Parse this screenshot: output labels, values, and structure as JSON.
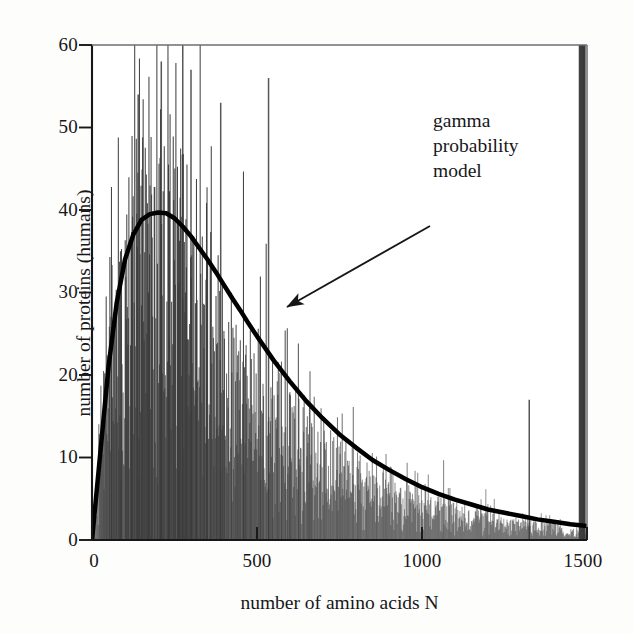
{
  "chart_data": {
    "type": "bar",
    "title": "",
    "subtitle": "",
    "xlabel": "number of amino acids N",
    "ylabel": "number of proteins (humans)",
    "xlim": [
      0,
      1500
    ],
    "ylim": [
      0,
      60
    ],
    "xticks": [
      0,
      500,
      1000,
      1500
    ],
    "xtick_labels": [
      "0",
      "500",
      "1000",
      "1500"
    ],
    "yticks": [
      0,
      10,
      20,
      30,
      40,
      50,
      60
    ],
    "ytick_labels": [
      "0",
      "10",
      "20",
      "30",
      "40",
      "50",
      "60"
    ],
    "grid": false,
    "legend_position": "none",
    "annotations": [
      {
        "text_lines": [
          "gamma",
          "probability",
          "model"
        ],
        "text": "gamma probability model",
        "arrow_from_x": 960,
        "arrow_from_y": 43,
        "arrow_to_x": 580,
        "arrow_to_y": 28
      }
    ],
    "series": [
      {
        "name": "histogram of human protein lengths",
        "type": "impulse",
        "render": "vertical-spikes",
        "color": "#3a3a3a",
        "bin_width": 1,
        "note": "Dense noisy per-N counts; envelope follows the gamma model with large scatter, several spikes clipped at/above 60.",
        "x": [
          5,
          15,
          25,
          35,
          45,
          55,
          65,
          75,
          85,
          95,
          105,
          115,
          125,
          135,
          145,
          155,
          165,
          175,
          185,
          195,
          205,
          215,
          225,
          235,
          245,
          255,
          265,
          275,
          285,
          295,
          305,
          315,
          325,
          335,
          345,
          355,
          365,
          375,
          385,
          395,
          405,
          415,
          425,
          435,
          445,
          455,
          465,
          475,
          485,
          495,
          505,
          515,
          525,
          535,
          545,
          555,
          565,
          575,
          585,
          595,
          605,
          615,
          625,
          635,
          645,
          655,
          665,
          675,
          685,
          695,
          705,
          715,
          725,
          735,
          745,
          755,
          765,
          775,
          785,
          795,
          805,
          815,
          825,
          835,
          845,
          855,
          865,
          875,
          885,
          895,
          905,
          915,
          925,
          935,
          945,
          955,
          965,
          975,
          985,
          995,
          1005,
          1015,
          1025,
          1035,
          1045,
          1055,
          1065,
          1075,
          1085,
          1095,
          1105,
          1115,
          1125,
          1135,
          1145,
          1155,
          1165,
          1175,
          1185,
          1195,
          1205,
          1215,
          1225,
          1235,
          1245,
          1255,
          1265,
          1275,
          1285,
          1295,
          1305,
          1315,
          1325,
          1335,
          1345,
          1355,
          1365,
          1375,
          1385,
          1395,
          1405,
          1415,
          1425,
          1435,
          1445,
          1455,
          1465,
          1475,
          1485,
          1495
        ],
        "y_envelope_mean": [
          2,
          6,
          12,
          18,
          24,
          28,
          32,
          35,
          36,
          37,
          38,
          39,
          39,
          40,
          40,
          40,
          40,
          39,
          39,
          38,
          38,
          37,
          37,
          36,
          35,
          34,
          33,
          32,
          31,
          30,
          30,
          29,
          28,
          27,
          27,
          26,
          25,
          24,
          24,
          23,
          22,
          22,
          21,
          21,
          20,
          20,
          19,
          19,
          18,
          18,
          17,
          17,
          16,
          16,
          15,
          15,
          15,
          14,
          14,
          13,
          13,
          13,
          12,
          12,
          12,
          11,
          11,
          11,
          10,
          10,
          10,
          10,
          9,
          9,
          9,
          9,
          8,
          8,
          8,
          8,
          8,
          7,
          7,
          7,
          7,
          7,
          6,
          6,
          6,
          6,
          6,
          6,
          5,
          5,
          5,
          5,
          5,
          5,
          5,
          5,
          4,
          4,
          4,
          4,
          4,
          4,
          4,
          4,
          4,
          4,
          3,
          3,
          3,
          3,
          3,
          3,
          3,
          3,
          3,
          3,
          3,
          3,
          3,
          2,
          2,
          2,
          2,
          2,
          2,
          2,
          2,
          2,
          2,
          2,
          2,
          2,
          2,
          2,
          2,
          2,
          2,
          2,
          1,
          1,
          1,
          1,
          1,
          1
        ],
        "peak_model_value": 39.7,
        "peak_model_x": 225,
        "max_observed_spike": 60,
        "notable_spikes": [
          {
            "x": 140,
            "y": 54
          },
          {
            "x": 210,
            "y": 58
          },
          {
            "x": 275,
            "y": 60
          },
          {
            "x": 300,
            "y": 57
          },
          {
            "x": 390,
            "y": 53
          },
          {
            "x": 535,
            "y": 56
          },
          {
            "x": 1325,
            "y": 17
          }
        ]
      },
      {
        "name": "gamma probability model",
        "type": "line",
        "color": "#000000",
        "linewidth": 4.5,
        "shape": "gamma density scaled",
        "x": [
          0,
          25,
          50,
          75,
          100,
          125,
          150,
          175,
          200,
          225,
          250,
          275,
          300,
          325,
          350,
          375,
          400,
          425,
          450,
          475,
          500,
          550,
          600,
          650,
          700,
          750,
          800,
          850,
          900,
          950,
          1000,
          1050,
          1100,
          1150,
          1200,
          1250,
          1300,
          1350,
          1400,
          1450,
          1500
        ],
        "y": [
          0,
          10.5,
          21.0,
          28.8,
          34.0,
          37.0,
          38.8,
          39.5,
          39.7,
          39.6,
          39.0,
          38.0,
          36.8,
          35.4,
          34.0,
          32.5,
          30.9,
          29.3,
          27.8,
          26.2,
          24.7,
          21.8,
          19.2,
          16.8,
          14.7,
          12.8,
          11.2,
          9.7,
          8.5,
          7.4,
          6.4,
          5.6,
          4.9,
          4.3,
          3.7,
          3.3,
          2.9,
          2.5,
          2.2,
          1.9,
          1.7
        ]
      }
    ]
  },
  "axes": {
    "y_title": "number of proteins (humans)",
    "x_title": "number of amino acids N",
    "y_tick_labels": [
      "60",
      "50",
      "40",
      "30",
      "20",
      "10",
      "0"
    ],
    "x_tick_labels": [
      "0",
      "500",
      "1000",
      "1500"
    ]
  },
  "annotation": {
    "line1": "gamma",
    "line2": "probability",
    "line3": "model"
  },
  "colors": {
    "axis": "#17171a",
    "model_curve": "#000000",
    "data_spikes": "#3f3f3f",
    "background": "#fdfdfc",
    "text": "#17171a"
  }
}
